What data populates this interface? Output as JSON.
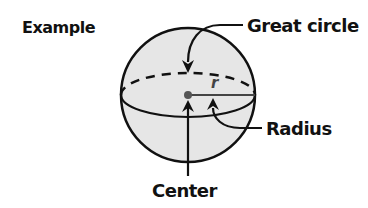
{
  "title": "Example",
  "labels": {
    "great_circle": "Great circle",
    "radius": "Radius",
    "center": "Center",
    "radius_symbol": "r"
  },
  "colors": {
    "sphere_fill": "#e6e6e6",
    "stroke": "#111111",
    "center_dot": "#555555"
  }
}
